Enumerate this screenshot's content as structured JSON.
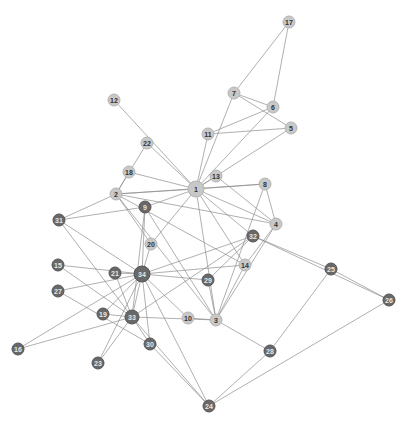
{
  "graph": {
    "title": "",
    "groups": {
      "light": {
        "color": "#c8c8c8",
        "label_color": "#333333"
      },
      "dark": {
        "color": "#686868",
        "label_color": "#e6e6e6"
      }
    },
    "nodes": [
      {
        "id": "1",
        "x": 196,
        "y": 189,
        "r": 8,
        "group": "light"
      },
      {
        "id": "2",
        "x": 116,
        "y": 194,
        "r": 6,
        "group": "light"
      },
      {
        "id": "3",
        "x": 216,
        "y": 320,
        "r": 6,
        "group": "light"
      },
      {
        "id": "4",
        "x": 276,
        "y": 224,
        "r": 6,
        "group": "light"
      },
      {
        "id": "5",
        "x": 291,
        "y": 128,
        "r": 6,
        "group": "light"
      },
      {
        "id": "6",
        "x": 273,
        "y": 107,
        "r": 6,
        "group": "light"
      },
      {
        "id": "7",
        "x": 234,
        "y": 93,
        "r": 6,
        "group": "light"
      },
      {
        "id": "8",
        "x": 265,
        "y": 184,
        "r": 6,
        "group": "light"
      },
      {
        "id": "9",
        "x": 145,
        "y": 207,
        "r": 6,
        "group": "dark"
      },
      {
        "id": "10",
        "x": 188,
        "y": 318,
        "r": 6,
        "group": "light"
      },
      {
        "id": "11",
        "x": 208,
        "y": 134,
        "r": 6,
        "group": "light"
      },
      {
        "id": "12",
        "x": 114,
        "y": 100,
        "r": 6,
        "group": "light"
      },
      {
        "id": "13",
        "x": 216,
        "y": 176,
        "r": 6,
        "group": "light"
      },
      {
        "id": "14",
        "x": 245,
        "y": 265,
        "r": 6,
        "group": "light"
      },
      {
        "id": "15",
        "x": 58,
        "y": 265,
        "r": 6,
        "group": "dark"
      },
      {
        "id": "16",
        "x": 18,
        "y": 349,
        "r": 6,
        "group": "dark"
      },
      {
        "id": "17",
        "x": 289,
        "y": 22,
        "r": 6,
        "group": "light"
      },
      {
        "id": "18",
        "x": 129,
        "y": 172,
        "r": 6,
        "group": "light"
      },
      {
        "id": "19",
        "x": 103,
        "y": 314,
        "r": 6,
        "group": "dark"
      },
      {
        "id": "20",
        "x": 151,
        "y": 244,
        "r": 6,
        "group": "light"
      },
      {
        "id": "21",
        "x": 115,
        "y": 273,
        "r": 6,
        "group": "dark"
      },
      {
        "id": "22",
        "x": 147,
        "y": 143,
        "r": 6,
        "group": "light"
      },
      {
        "id": "23",
        "x": 98,
        "y": 363,
        "r": 6,
        "group": "dark"
      },
      {
        "id": "24",
        "x": 209,
        "y": 406,
        "r": 6,
        "group": "dark"
      },
      {
        "id": "25",
        "x": 331,
        "y": 269,
        "r": 6,
        "group": "dark"
      },
      {
        "id": "26",
        "x": 389,
        "y": 300,
        "r": 6,
        "group": "dark"
      },
      {
        "id": "27",
        "x": 58,
        "y": 291,
        "r": 6,
        "group": "dark"
      },
      {
        "id": "28",
        "x": 270,
        "y": 351,
        "r": 6,
        "group": "dark"
      },
      {
        "id": "29",
        "x": 208,
        "y": 280,
        "r": 6,
        "group": "dark"
      },
      {
        "id": "30",
        "x": 150,
        "y": 344,
        "r": 6,
        "group": "dark"
      },
      {
        "id": "31",
        "x": 59,
        "y": 220,
        "r": 6,
        "group": "dark"
      },
      {
        "id": "32",
        "x": 253,
        "y": 236,
        "r": 6,
        "group": "dark"
      },
      {
        "id": "33",
        "x": 132,
        "y": 317,
        "r": 7,
        "group": "dark"
      },
      {
        "id": "34",
        "x": 142,
        "y": 274,
        "r": 8,
        "group": "dark"
      }
    ],
    "edges": [
      [
        "1",
        "2"
      ],
      [
        "1",
        "3"
      ],
      [
        "1",
        "4"
      ],
      [
        "1",
        "5"
      ],
      [
        "1",
        "6"
      ],
      [
        "1",
        "7"
      ],
      [
        "1",
        "8"
      ],
      [
        "1",
        "9"
      ],
      [
        "1",
        "11"
      ],
      [
        "1",
        "12"
      ],
      [
        "1",
        "13"
      ],
      [
        "1",
        "14"
      ],
      [
        "1",
        "18"
      ],
      [
        "1",
        "20"
      ],
      [
        "1",
        "22"
      ],
      [
        "1",
        "32"
      ],
      [
        "2",
        "3"
      ],
      [
        "2",
        "4"
      ],
      [
        "2",
        "8"
      ],
      [
        "2",
        "14"
      ],
      [
        "2",
        "18"
      ],
      [
        "2",
        "20"
      ],
      [
        "2",
        "22"
      ],
      [
        "2",
        "31"
      ],
      [
        "3",
        "4"
      ],
      [
        "3",
        "8"
      ],
      [
        "3",
        "9"
      ],
      [
        "3",
        "10"
      ],
      [
        "3",
        "14"
      ],
      [
        "3",
        "28"
      ],
      [
        "3",
        "29"
      ],
      [
        "3",
        "33"
      ],
      [
        "4",
        "8"
      ],
      [
        "4",
        "13"
      ],
      [
        "4",
        "14"
      ],
      [
        "5",
        "7"
      ],
      [
        "5",
        "11"
      ],
      [
        "6",
        "7"
      ],
      [
        "6",
        "11"
      ],
      [
        "6",
        "17"
      ],
      [
        "7",
        "17"
      ],
      [
        "9",
        "31"
      ],
      [
        "9",
        "33"
      ],
      [
        "9",
        "34"
      ],
      [
        "10",
        "34"
      ],
      [
        "14",
        "34"
      ],
      [
        "15",
        "33"
      ],
      [
        "15",
        "34"
      ],
      [
        "16",
        "33"
      ],
      [
        "16",
        "34"
      ],
      [
        "19",
        "33"
      ],
      [
        "19",
        "34"
      ],
      [
        "20",
        "34"
      ],
      [
        "21",
        "33"
      ],
      [
        "21",
        "34"
      ],
      [
        "23",
        "33"
      ],
      [
        "23",
        "34"
      ],
      [
        "24",
        "26"
      ],
      [
        "24",
        "28"
      ],
      [
        "24",
        "30"
      ],
      [
        "24",
        "33"
      ],
      [
        "24",
        "34"
      ],
      [
        "25",
        "26"
      ],
      [
        "25",
        "28"
      ],
      [
        "25",
        "32"
      ],
      [
        "26",
        "32"
      ],
      [
        "27",
        "30"
      ],
      [
        "27",
        "34"
      ],
      [
        "29",
        "32"
      ],
      [
        "29",
        "34"
      ],
      [
        "30",
        "33"
      ],
      [
        "30",
        "34"
      ],
      [
        "31",
        "33"
      ],
      [
        "31",
        "34"
      ],
      [
        "32",
        "33"
      ],
      [
        "32",
        "34"
      ],
      [
        "33",
        "34"
      ]
    ]
  }
}
